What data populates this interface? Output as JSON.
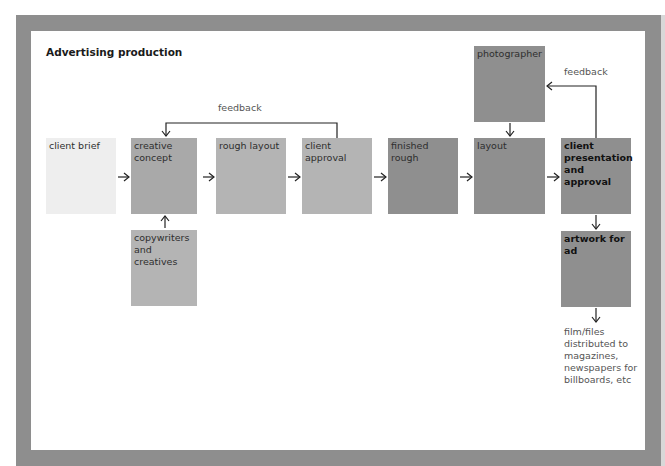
{
  "title": "Advertising production",
  "boxes": {
    "client_brief": "client brief",
    "creative_concept": "creative concept",
    "copywriters": "copywriters and creatives",
    "rough_layout": "rough layout",
    "client_approval": "client approval",
    "finished_rough": "finished rough",
    "layout": "layout",
    "photographer": "photographer",
    "client_presentation": "client presentation and approval",
    "artwork": "artwork for ad"
  },
  "labels": {
    "feedback_1": "feedback",
    "feedback_2": "feedback",
    "distribution": "film/files distributed to magazines, newspapers for billboards, etc"
  },
  "colors": {
    "frame": "#8e8e8e",
    "box_light": "#eeeeee",
    "box_mid": "#b4b4b4",
    "box_dark": "#8f8f8f"
  }
}
